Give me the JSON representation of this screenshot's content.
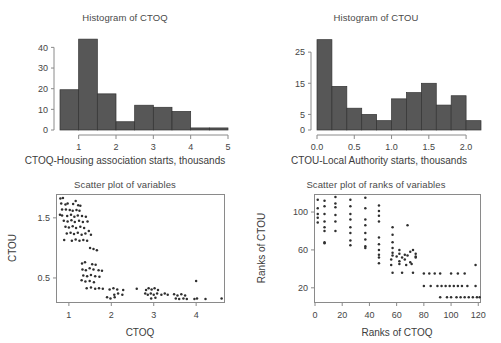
{
  "figure": {
    "panels": [
      {
        "id": "hist-ctoq",
        "title": "Histogram of CTOQ",
        "xlabel": "CTOQ-Housing association starts, thousands",
        "ylabel": "",
        "xticks": [
          "1",
          "2",
          "3",
          "4",
          "5"
        ],
        "yticks": [
          "0",
          "10",
          "20",
          "30",
          "40"
        ]
      },
      {
        "id": "hist-ctou",
        "title": "Histogram of CTOU",
        "xlabel": "CTOU-Local Authority starts, thousands",
        "ylabel": "",
        "xticks": [
          "0.0",
          "0.5",
          "1.0",
          "1.5",
          "2.0"
        ],
        "yticks": [
          "0",
          "5",
          "15",
          "25"
        ]
      },
      {
        "id": "scatter-vars",
        "title": "Scatter plot of variables",
        "xlabel": "CTOQ",
        "ylabel": "CTOU",
        "xticks": [
          "1",
          "2",
          "3",
          "4"
        ],
        "yticks": [
          "0.5",
          "1.5"
        ]
      },
      {
        "id": "scatter-ranks",
        "title": "Scatter plot of ranks of variables",
        "xlabel": "Ranks of CTOQ",
        "ylabel": "Ranks of CTOU",
        "xticks": [
          "0",
          "20",
          "40",
          "60",
          "80",
          "100",
          "120"
        ],
        "yticks": [
          "20",
          "60",
          "100"
        ]
      }
    ]
  },
  "chart_data": [
    {
      "type": "bar",
      "id": "hist-ctoq",
      "title": "Histogram of CTOQ",
      "xlabel": "CTOQ-Housing association starts, thousands",
      "ylabel": "",
      "xlim": [
        0.5,
        5.0
      ],
      "ylim": [
        0,
        44
      ],
      "grid": false,
      "legend": null,
      "bin_width": 0.5,
      "bin_edges": [
        0.5,
        1.0,
        1.5,
        2.0,
        2.5,
        3.0,
        3.5,
        4.0,
        4.5,
        5.0
      ],
      "values": [
        19.5,
        44,
        17.5,
        4,
        12,
        11,
        9,
        1,
        1
      ],
      "xticks": [
        1,
        2,
        3,
        4,
        5
      ],
      "yticks": [
        0,
        10,
        20,
        30,
        40
      ]
    },
    {
      "type": "bar",
      "id": "hist-ctou",
      "title": "Histogram of CTOU",
      "xlabel": "CTOU-Local Authority starts, thousands",
      "ylabel": "",
      "xlim": [
        0.0,
        2.2
      ],
      "ylim": [
        0,
        29
      ],
      "grid": false,
      "legend": null,
      "bin_width": 0.2,
      "bin_edges": [
        0.0,
        0.2,
        0.4,
        0.6,
        0.8,
        1.0,
        1.2,
        1.4,
        1.6,
        1.8,
        2.0,
        2.2
      ],
      "values": [
        29,
        14,
        7,
        5,
        3,
        10,
        12,
        15,
        8,
        11,
        3
      ],
      "xticks": [
        0.0,
        0.5,
        1.0,
        1.5,
        2.0
      ],
      "yticks": [
        0,
        5,
        15,
        25
      ]
    },
    {
      "type": "scatter",
      "id": "scatter-vars",
      "title": "Scatter plot of variables",
      "xlabel": "CTOQ",
      "ylabel": "CTOU",
      "xlim": [
        0.72,
        4.68
      ],
      "ylim": [
        0.1,
        1.88
      ],
      "grid": false,
      "legend": null,
      "xticks": [
        1,
        2,
        3,
        4
      ],
      "yticks": [
        0.5,
        1.5
      ],
      "points": [
        [
          0.8,
          1.82
        ],
        [
          0.86,
          1.83
        ],
        [
          0.82,
          1.74
        ],
        [
          0.92,
          1.72
        ],
        [
          0.97,
          1.74
        ],
        [
          1.1,
          1.73
        ],
        [
          1.16,
          1.78
        ],
        [
          1.22,
          1.71
        ],
        [
          1.27,
          1.7
        ],
        [
          0.84,
          1.64
        ],
        [
          0.93,
          1.64
        ],
        [
          1.02,
          1.63
        ],
        [
          1.09,
          1.62
        ],
        [
          1.18,
          1.63
        ],
        [
          1.25,
          1.62
        ],
        [
          0.79,
          1.55
        ],
        [
          0.84,
          1.54
        ],
        [
          0.96,
          1.53
        ],
        [
          1.05,
          1.55
        ],
        [
          1.13,
          1.52
        ],
        [
          1.21,
          1.54
        ],
        [
          1.31,
          1.53
        ],
        [
          1.4,
          1.52
        ],
        [
          0.88,
          1.45
        ],
        [
          0.97,
          1.44
        ],
        [
          1.06,
          1.46
        ],
        [
          1.14,
          1.43
        ],
        [
          1.24,
          1.45
        ],
        [
          1.33,
          1.43
        ],
        [
          1.44,
          1.44
        ],
        [
          0.92,
          1.35
        ],
        [
          1.0,
          1.34
        ],
        [
          1.09,
          1.36
        ],
        [
          1.17,
          1.33
        ],
        [
          1.27,
          1.35
        ],
        [
          1.36,
          1.33
        ],
        [
          1.47,
          1.28
        ],
        [
          0.95,
          1.24
        ],
        [
          1.04,
          1.25
        ],
        [
          1.12,
          1.23
        ],
        [
          1.21,
          1.25
        ],
        [
          1.3,
          1.22
        ],
        [
          1.39,
          1.24
        ],
        [
          1.52,
          1.22
        ],
        [
          0.89,
          1.13
        ],
        [
          1.07,
          1.12
        ],
        [
          1.16,
          1.14
        ],
        [
          1.25,
          1.12
        ],
        [
          1.34,
          1.13
        ],
        [
          1.43,
          1.12
        ],
        [
          1.5,
          1.0
        ],
        [
          1.58,
          0.98
        ],
        [
          1.66,
          0.96
        ],
        [
          1.31,
          0.74
        ],
        [
          1.38,
          0.76
        ],
        [
          1.55,
          0.73
        ],
        [
          1.63,
          0.72
        ],
        [
          1.32,
          0.64
        ],
        [
          1.4,
          0.63
        ],
        [
          1.49,
          0.66
        ],
        [
          1.58,
          0.64
        ],
        [
          1.7,
          0.63
        ],
        [
          1.78,
          0.62
        ],
        [
          1.34,
          0.54
        ],
        [
          1.43,
          0.53
        ],
        [
          1.52,
          0.55
        ],
        [
          1.62,
          0.53
        ],
        [
          1.72,
          0.52
        ],
        [
          1.3,
          0.46
        ],
        [
          1.39,
          0.44
        ],
        [
          1.49,
          0.45
        ],
        [
          1.59,
          0.43
        ],
        [
          4.0,
          0.45
        ],
        [
          1.42,
          0.33
        ],
        [
          1.52,
          0.34
        ],
        [
          1.62,
          0.32
        ],
        [
          1.71,
          0.33
        ],
        [
          1.8,
          0.32
        ],
        [
          1.96,
          0.31
        ],
        [
          2.05,
          0.33
        ],
        [
          2.14,
          0.31
        ],
        [
          2.28,
          0.3
        ],
        [
          2.6,
          0.32
        ],
        [
          2.82,
          0.3
        ],
        [
          2.88,
          0.33
        ],
        [
          2.95,
          0.31
        ],
        [
          3.02,
          0.33
        ],
        [
          3.1,
          0.3
        ],
        [
          2.8,
          0.24
        ],
        [
          2.86,
          0.22
        ],
        [
          2.93,
          0.24
        ],
        [
          3.0,
          0.22
        ],
        [
          3.08,
          0.24
        ],
        [
          3.18,
          0.22
        ],
        [
          3.26,
          0.24
        ],
        [
          3.33,
          0.22
        ],
        [
          2.07,
          0.22
        ],
        [
          2.16,
          0.24
        ],
        [
          2.26,
          0.22
        ],
        [
          3.48,
          0.23
        ],
        [
          3.56,
          0.21
        ],
        [
          3.65,
          0.23
        ],
        [
          3.74,
          0.21
        ],
        [
          3.52,
          0.16
        ],
        [
          3.6,
          0.15
        ],
        [
          3.7,
          0.16
        ],
        [
          3.78,
          0.15
        ],
        [
          3.96,
          0.15
        ],
        [
          4.02,
          0.16
        ],
        [
          4.22,
          0.15
        ],
        [
          4.6,
          0.16
        ],
        [
          1.9,
          0.18
        ],
        [
          1.98,
          0.16
        ],
        [
          2.08,
          0.18
        ],
        [
          2.94,
          0.16
        ],
        [
          3.04,
          0.17
        ]
      ]
    },
    {
      "type": "scatter",
      "id": "scatter-ranks",
      "title": "Scatter plot of ranks of variables",
      "xlabel": "Ranks of CTOQ",
      "ylabel": "Ranks of CTOU",
      "xlim": [
        0,
        122
      ],
      "ylim": [
        5,
        118
      ],
      "grid": false,
      "legend": null,
      "xticks": [
        0,
        20,
        40,
        60,
        80,
        100,
        120
      ],
      "yticks": [
        20,
        60,
        100
      ],
      "points": [
        [
          2,
          113
        ],
        [
          7,
          112
        ],
        [
          15,
          116
        ],
        [
          15,
          109
        ],
        [
          26,
          113
        ],
        [
          37,
          115
        ],
        [
          2,
          104
        ],
        [
          7,
          106
        ],
        [
          15,
          105
        ],
        [
          26,
          106
        ],
        [
          37,
          104
        ],
        [
          47,
          107
        ],
        [
          2,
          98
        ],
        [
          7,
          98
        ],
        [
          15,
          97
        ],
        [
          26,
          98
        ],
        [
          47,
          101
        ],
        [
          2,
          94
        ],
        [
          7,
          90
        ],
        [
          15,
          90
        ],
        [
          26,
          92
        ],
        [
          37,
          92
        ],
        [
          47,
          96
        ],
        [
          2,
          89
        ],
        [
          7,
          84
        ],
        [
          26,
          84
        ],
        [
          37,
          86
        ],
        [
          47,
          90
        ],
        [
          7,
          80
        ],
        [
          15,
          80
        ],
        [
          26,
          78
        ],
        [
          37,
          78
        ],
        [
          57,
          84
        ],
        [
          68,
          86
        ],
        [
          7,
          68
        ],
        [
          26,
          70
        ],
        [
          37,
          71
        ],
        [
          47,
          73
        ],
        [
          57,
          76
        ],
        [
          7,
          67
        ],
        [
          26,
          65
        ],
        [
          37,
          64
        ],
        [
          47,
          66
        ],
        [
          57,
          68
        ],
        [
          37,
          62
        ],
        [
          47,
          60
        ],
        [
          57,
          62
        ],
        [
          62,
          60
        ],
        [
          72,
          60
        ],
        [
          47,
          55
        ],
        [
          57,
          57
        ],
        [
          62,
          56
        ],
        [
          66,
          55
        ],
        [
          70,
          58
        ],
        [
          74,
          56
        ],
        [
          47,
          52
        ],
        [
          57,
          54
        ],
        [
          60,
          53
        ],
        [
          64,
          52
        ],
        [
          68,
          54
        ],
        [
          74,
          53
        ],
        [
          47,
          46
        ],
        [
          56,
          50
        ],
        [
          62,
          48
        ],
        [
          66,
          50
        ],
        [
          70,
          47
        ],
        [
          74,
          52
        ],
        [
          56,
          44
        ],
        [
          62,
          45
        ],
        [
          67,
          44
        ],
        [
          71,
          45
        ],
        [
          57,
          36
        ],
        [
          64,
          36
        ],
        [
          72,
          36
        ],
        [
          80,
          35
        ],
        [
          84,
          35
        ],
        [
          88,
          35
        ],
        [
          92,
          35
        ],
        [
          100,
          35
        ],
        [
          105,
          35
        ],
        [
          110,
          35
        ],
        [
          118,
          44
        ],
        [
          80,
          22
        ],
        [
          85,
          22
        ],
        [
          90,
          22
        ],
        [
          93,
          22
        ],
        [
          96,
          22
        ],
        [
          99,
          22
        ],
        [
          102,
          22
        ],
        [
          105,
          22
        ],
        [
          108,
          22
        ],
        [
          112,
          22
        ],
        [
          118,
          22
        ],
        [
          92,
          10
        ],
        [
          97,
          10
        ],
        [
          104,
          10
        ],
        [
          107,
          10
        ],
        [
          110,
          10
        ],
        [
          113,
          10
        ],
        [
          116,
          10
        ],
        [
          119,
          10
        ],
        [
          121,
          10
        ],
        [
          100,
          10
        ]
      ]
    }
  ]
}
